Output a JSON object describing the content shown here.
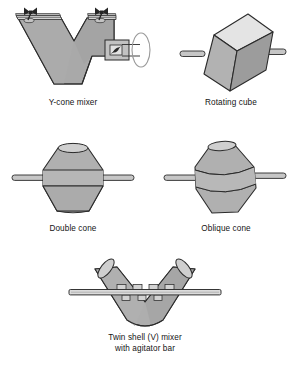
{
  "figure": {
    "background_color": "#ffffff",
    "panels": [
      {
        "id": "y-cone-mixer",
        "caption": "Y-cone mixer",
        "icon": "y-cone-mixer-diagram",
        "description": "V/Y shaped twin-arm shell with flanged and clamped top openings and a side drive housing with impeller and drive wheel",
        "parts": [
          "left-arm-shell",
          "right-arm-shell",
          "left-flange",
          "right-flange",
          "left-clamp",
          "right-clamp",
          "drive-housing",
          "impeller-blade",
          "drive-shaft-lines",
          "drive-wheel-ellipse"
        ]
      },
      {
        "id": "rotating-cube",
        "caption": "Rotating cube",
        "icon": "rotating-cube-diagram",
        "description": "Tilted cube shown in isometric view with a light top face, mid-grey left face and dark right face, with horizontal trunnion shafts on both sides",
        "parts": [
          "cube-top-face",
          "cube-left-face",
          "cube-right-face",
          "left-shaft",
          "right-shaft"
        ]
      },
      {
        "id": "double-cone",
        "caption": "Double cone",
        "icon": "double-cone-diagram",
        "description": "Symmetrical double cone blender with a central cylindrical band, open elliptical top and horizontal trunnion shafts",
        "parts": [
          "upper-cone",
          "central-band",
          "lower-cone",
          "top-opening-ellipse",
          "left-shaft",
          "right-shaft"
        ]
      },
      {
        "id": "oblique-cone",
        "caption": "Oblique cone",
        "icon": "oblique-cone-diagram",
        "description": "Asymmetric slanted double cone blender with inclined seam bands and horizontal trunnion shafts",
        "parts": [
          "upper-cone",
          "central-band",
          "lower-cone",
          "top-opening-ellipse",
          "left-shaft",
          "right-shaft"
        ]
      },
      {
        "id": "twin-shell-v-mixer",
        "caption": "Twin shell (V) mixer\nwith agitator bar",
        "icon": "twin-shell-v-mixer-diagram",
        "description": "V shaped twin shell blender with two cylindrical arms and a horizontal agitator bar carrying small paddle blades",
        "parts": [
          "left-arm-shell",
          "right-arm-shell",
          "left-top-ellipse",
          "right-top-ellipse",
          "agitator-bar",
          "agitator-blades"
        ]
      }
    ],
    "colors": {
      "outline": "#2b2b2b",
      "shell_fill": "#a9a9a9",
      "shell_fill_light": "#c9c9c9",
      "shell_fill_lighter": "#d9d9d9",
      "shell_fill_dark": "#8e8e8e",
      "highlight": "#e8e8e8",
      "clamp": "#262626",
      "text": "#141414"
    }
  }
}
